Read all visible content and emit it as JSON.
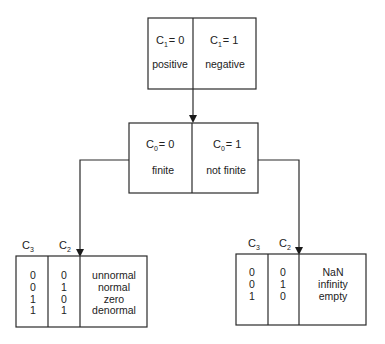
{
  "diagram": {
    "type": "classification-tree",
    "top_node": {
      "left": {
        "cond_var": "C",
        "cond_sub": "1",
        "cond_val": "= 0",
        "label": "positive"
      },
      "right": {
        "cond_var": "C",
        "cond_sub": "1",
        "cond_val": "= 1",
        "label": "negative"
      }
    },
    "middle_node": {
      "left": {
        "cond_var": "C",
        "cond_sub": "0",
        "cond_val": "= 0",
        "label": "finite"
      },
      "right": {
        "cond_var": "C",
        "cond_sub": "0",
        "cond_val": "= 1",
        "label": "not finite"
      }
    },
    "finite_table": {
      "headers": [
        {
          "var": "C",
          "sub": "3"
        },
        {
          "var": "C",
          "sub": "2"
        }
      ],
      "rows": [
        {
          "c3": "0",
          "c2": "0",
          "label": "unnormal"
        },
        {
          "c3": "0",
          "c2": "1",
          "label": "normal"
        },
        {
          "c3": "1",
          "c2": "0",
          "label": "zero"
        },
        {
          "c3": "1",
          "c2": "1",
          "label": "denormal"
        }
      ]
    },
    "not_finite_table": {
      "headers": [
        {
          "var": "C",
          "sub": "3"
        },
        {
          "var": "C",
          "sub": "2"
        }
      ],
      "rows": [
        {
          "c3": "0",
          "c2": "0",
          "label": "NaN"
        },
        {
          "c3": "0",
          "c2": "1",
          "label": "infinity"
        },
        {
          "c3": "1",
          "c2": "0",
          "label": "empty"
        }
      ]
    },
    "edges": [
      {
        "from": "top_node",
        "to": "middle_node"
      },
      {
        "from": "middle_node.left",
        "to": "finite_table"
      },
      {
        "from": "middle_node.right",
        "to": "not_finite_table"
      }
    ]
  }
}
